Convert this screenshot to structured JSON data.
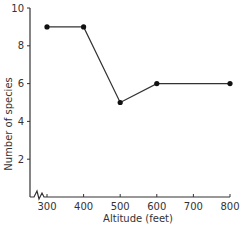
{
  "chart_data": {
    "type": "line",
    "title": "",
    "xlabel": "Altitude (feet)",
    "ylabel": "Number of species",
    "x": [
      300,
      400,
      500,
      600,
      800
    ],
    "values": [
      9,
      9,
      5,
      6,
      6
    ],
    "series": [
      {
        "name": "Number of species",
        "x": [
          300,
          400,
          500,
          600,
          800
        ],
        "values": [
          9,
          9,
          5,
          6,
          6
        ]
      }
    ],
    "xticks": [
      "300",
      "400",
      "500",
      "600",
      "700",
      "800"
    ],
    "yticks": [
      "2",
      "4",
      "6",
      "8",
      "10"
    ],
    "xlim": [
      250,
      800
    ],
    "ylim": [
      0,
      10
    ],
    "axis_break": "x-axis break between origin and 300",
    "grid": false,
    "legend": "none",
    "colors": {
      "line": "#333333",
      "marker": "#111111",
      "axis": "#333333"
    }
  }
}
